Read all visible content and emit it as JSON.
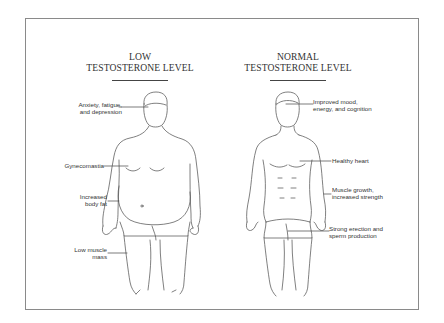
{
  "figure": {
    "left_panel": {
      "title_line1": "LOW",
      "title_line2": "TESTOSTERONE LEVEL",
      "labels": [
        {
          "id": "anxiety",
          "line1": "Anxiety, fatigue,",
          "line2": "and depression"
        },
        {
          "id": "gynecomastia",
          "line1": "Gynecomastia",
          "line2": ""
        },
        {
          "id": "body-fat",
          "line1": "Increased",
          "line2": "body fat"
        },
        {
          "id": "low-muscle",
          "line1": "Low muscle",
          "line2": "mass"
        }
      ]
    },
    "right_panel": {
      "title_line1": "NORMAL",
      "title_line2": "TESTOSTERONE LEVEL",
      "labels": [
        {
          "id": "mood",
          "line1": "Improved mood,",
          "line2": "energy, and cognition"
        },
        {
          "id": "heart",
          "line1": "Healthy heart",
          "line2": ""
        },
        {
          "id": "muscle",
          "line1": "Muscle growth,",
          "line2": "increased strength"
        },
        {
          "id": "erection",
          "line1": "Strong erection and",
          "line2": "sperm production"
        }
      ]
    },
    "colors": {
      "frame": "#8a8a8a",
      "line_art": "#555555",
      "text": "#333333",
      "background": "#ffffff"
    }
  }
}
